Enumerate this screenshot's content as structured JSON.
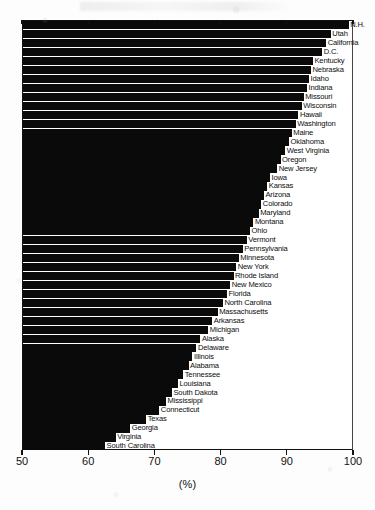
{
  "chart_data": {
    "type": "bar",
    "orientation": "horizontal",
    "title": "",
    "subtitle": "",
    "xlabel": "(%)",
    "ylabel": "",
    "xlim": [
      50,
      100
    ],
    "ylim": null,
    "xticks": [
      50,
      60,
      70,
      80,
      90,
      100
    ],
    "xtick_labels": [
      "50",
      "60",
      "70",
      "80",
      "90",
      "100"
    ],
    "grid": false,
    "legend": null,
    "bar_color": "#0a0a0a",
    "sorted": "descending",
    "categories": [
      "N.H.",
      "Utah",
      "California",
      "D.C.",
      "Kentucky",
      "Nebraska",
      "Idaho",
      "Indiana",
      "Missouri",
      "Wisconsin",
      "Hawaii",
      "Washington",
      "Maine",
      "Oklahoma",
      "West Virginia",
      "Oregon",
      "New Jersey",
      "Iowa",
      "Kansas",
      "Arizona",
      "Colorado",
      "Maryland",
      "Montana",
      "Ohio",
      "Vermont",
      "Pennsylvania",
      "Minnesota",
      "New York",
      "Rhode Island",
      "New Mexico",
      "Florida",
      "North Carolina",
      "Massachusetts",
      "Arkansas",
      "Michigan",
      "Alaska",
      "Delaware",
      "Illinois",
      "Alabama",
      "Tennessee",
      "Louisiana",
      "South Dakota",
      "Mississippi",
      "Connecticut",
      "Texas",
      "Georgia",
      "Virginia",
      "South Carolina"
    ],
    "values": [
      99.2,
      96.5,
      95.8,
      95.2,
      93.8,
      93.5,
      93.2,
      92.9,
      92.4,
      92.1,
      91.6,
      91.2,
      90.6,
      90.2,
      89.6,
      88.9,
      88.4,
      87.3,
      86.9,
      86.4,
      86.0,
      85.6,
      84.8,
      84.3,
      83.8,
      83.2,
      82.6,
      82.2,
      81.8,
      81.3,
      80.8,
      80.2,
      79.4,
      78.6,
      78.0,
      76.8,
      76.2,
      75.6,
      75.0,
      74.2,
      73.4,
      72.5,
      71.6,
      70.6,
      68.6,
      66.2,
      64.0,
      62.4
    ],
    "units": "percent",
    "n_categories": 48
  },
  "axis": {
    "x_title": "(%)"
  }
}
